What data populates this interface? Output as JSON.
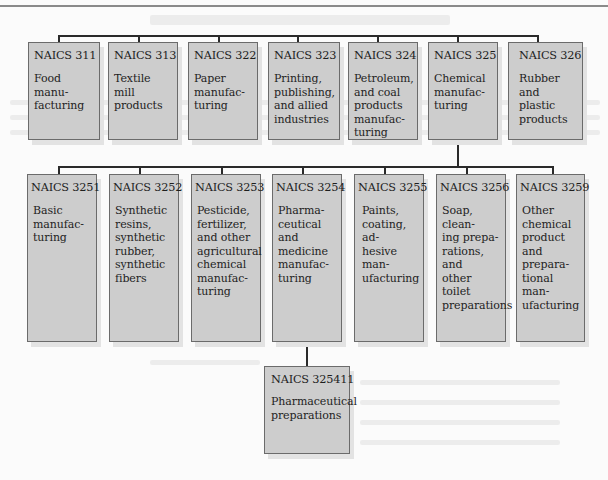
{
  "diagram": {
    "type": "hierarchy",
    "root_level": [
      {
        "code": "NAICS 311",
        "label": "Food manu-\nfacturing"
      },
      {
        "code": "NAICS 313",
        "label": "Textile mill\nproducts"
      },
      {
        "code": "NAICS 322",
        "label": "Paper\nmanufac-\nturing"
      },
      {
        "code": "NAICS 323",
        "label": "Printing,\npublishing,\nand allied\nindustries"
      },
      {
        "code": "NAICS 324",
        "label": "Petroleum,\nand coal\nproducts\nmanufac-\nturing"
      },
      {
        "code": "NAICS 325",
        "label": "Chemical\nmanufac-\nturing"
      },
      {
        "code": "NAICS 326",
        "label": "Rubber and\nplastic\nproducts"
      }
    ],
    "level_2_parent": "NAICS 325",
    "level_2": [
      {
        "code": "NAICS 3251",
        "label": "Basic\nmanufac-\nturing"
      },
      {
        "code": "NAICS 3252",
        "label": "Synthetic\nresins,\nsynthetic\nrubber,\nsynthetic\nfibers"
      },
      {
        "code": "NAICS 3253",
        "label": "Pesticide,\nfertilizer,\nand other\nagricultural\nchemical\nmanufac-\nturing"
      },
      {
        "code": "NAICS 3254",
        "label": "Pharma-\nceutical and\nmedicine\nmanufac-\nturing"
      },
      {
        "code": "NAICS 3255",
        "label": "Paints,\ncoating, ad-\nhesive man-\nufacturing"
      },
      {
        "code": "NAICS 3256",
        "label": "Soap, clean-\ning prepa-\nrations, and\nother toilet\npreparations"
      },
      {
        "code": "NAICS 3259",
        "label": "Other\nchemical\nproduct and\nprepara-\ntional man-\nufacturing"
      }
    ],
    "level_3_parent": "NAICS 3254",
    "level_3": [
      {
        "code": "NAICS 325411",
        "label": "Pharmaceutical\npreparations"
      }
    ],
    "colors": {
      "box_fill": "#cdcdcd",
      "box_border": "#6b6b6b",
      "connector": "#2a2a2a"
    }
  }
}
